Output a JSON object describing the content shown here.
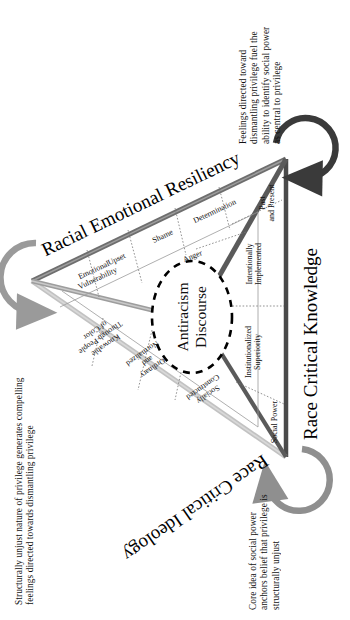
{
  "figure": {
    "type": "conceptual-triangle-diagram",
    "core_label_line1": "Antiracism",
    "core_label_line2": "Discourse",
    "sides": [
      {
        "id": "racial-emotional-resiliency",
        "label": "Racial Emotional Resiliency",
        "color": "#6e6e6e"
      },
      {
        "id": "race-critical-knowledge",
        "label": "Race Critical Knowledge",
        "color": "#4f4f4f"
      },
      {
        "id": "race-critical-ideology",
        "label": "Race Critical Ideology",
        "color": "#b9b9b9"
      }
    ],
    "segments": {
      "racial_emotional_resiliency": [
        {
          "id": "emotional-vulnerability",
          "line1": "Emotional",
          "line2": "Vulnerability"
        },
        {
          "id": "upset",
          "line1": "Upset",
          "line2": ""
        },
        {
          "id": "shame",
          "line1": "Shame",
          "line2": ""
        },
        {
          "id": "determination",
          "line1": "Determination",
          "line2": ""
        },
        {
          "id": "anger",
          "line1": "Anger",
          "line2": ""
        }
      ],
      "race_critical_knowledge": [
        {
          "id": "past-and-present",
          "line1": "Past",
          "line2": "and Present"
        },
        {
          "id": "intentionally-implemented",
          "line1": "Intentionally",
          "line2": "Implemented"
        },
        {
          "id": "institutionalized-superiority",
          "line1": "Institutionalized",
          "line2": "Superiority"
        },
        {
          "id": "social-power",
          "line1": "Social Power",
          "line2": ""
        }
      ],
      "race_critical_ideology": [
        {
          "id": "knowable-through-people-of-color",
          "line1": "Knowable",
          "line2": "Through People",
          "line3": "of Color"
        },
        {
          "id": "ordinary-and-normalized",
          "line1": "Ordinary",
          "line2": "and",
          "line3": "Normalized"
        },
        {
          "id": "socially-constructed",
          "line1": "Socially",
          "line2": "Constructed",
          "line3": ""
        }
      ]
    },
    "captions": [
      {
        "id": "caption-top-right",
        "vertex": "top-right",
        "text": "Feelings directed toward dismantling privilege fuel the ability to identify social power as central to privilege",
        "arrow": "curved-arrow-dark"
      },
      {
        "id": "caption-left",
        "vertex": "left",
        "text": "Structurally unjust nature of privilege generates compelling feelings directed towards dismantling privilege",
        "arrow": "curved-arrow-gray"
      },
      {
        "id": "caption-bottom-right",
        "vertex": "bottom-right",
        "text": "Core idea of social power anchors belief that privilege is structurally unjust",
        "arrow": "curved-arrow-gray"
      }
    ],
    "colors": {
      "ink": "#111111",
      "edge_dark": "#4f4f4f",
      "edge_mid": "#6e6e6e",
      "edge_light": "#b9b9b9",
      "spoke_dark": "#555555",
      "dashed": "#000000",
      "background": "#ffffff"
    }
  }
}
